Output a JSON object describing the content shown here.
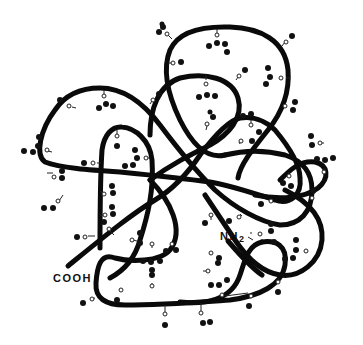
{
  "diagram": {
    "type": "glycoprotein-schematic",
    "colors": {
      "chain": "#0a0a0a",
      "sugar": "#111111",
      "background": "#ffffff"
    },
    "labels": {
      "c_terminus": "COOH",
      "n_terminus": "NH",
      "n_terminus_subscript": "2"
    },
    "elements": {
      "polypeptide_chain": "thick-black-curve",
      "side_chain_link": "open-circle",
      "sugar_residue": "filled-black-blob"
    },
    "side_chain_count": 46
  }
}
